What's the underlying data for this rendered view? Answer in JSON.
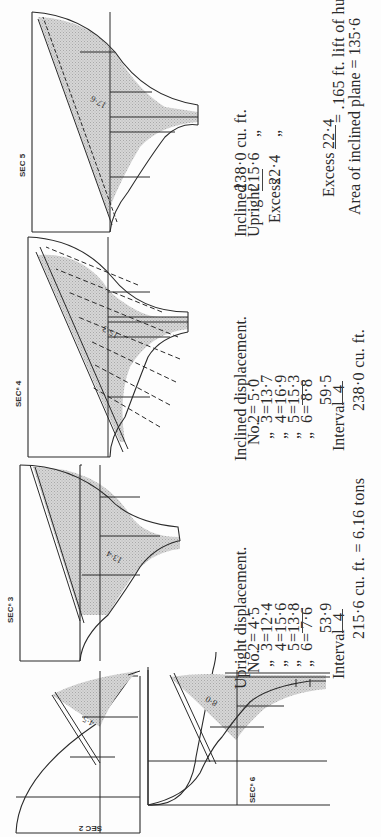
{
  "sections": [
    {
      "id": "sec2",
      "label": "SEC 2",
      "area_label": "4·5"
    },
    {
      "id": "sec6",
      "label": "SECⁿ 6",
      "area_label": "8·0"
    },
    {
      "id": "sec3",
      "label": "SECⁿ 3",
      "area_label": "13·4"
    },
    {
      "id": "sec4",
      "label": "SECⁿ 4",
      "area_label": "15·3"
    },
    {
      "id": "sec5",
      "label": "SEC 5",
      "area_label": "17·6"
    }
  ],
  "upright": {
    "heading": "Upright displacement.",
    "rows": [
      {
        "prefix": "No.",
        "n": "2",
        "value": "4·5"
      },
      {
        "prefix": "„",
        "n": "3",
        "value": "12·4"
      },
      {
        "prefix": "„",
        "n": "4",
        "value": "15·6"
      },
      {
        "prefix": "„",
        "n": "5",
        "value": "13·8"
      },
      {
        "prefix": "„",
        "n": "6",
        "value": "7·6"
      }
    ],
    "sum": "53·9",
    "interval_label": "Interval",
    "interval": "4",
    "result": "215·6 cu.  ft. = 6.16 tons"
  },
  "inclined": {
    "heading": "Inclined displacement.",
    "rows": [
      {
        "prefix": "No.",
        "n": "2",
        "value": "5·0"
      },
      {
        "prefix": "„",
        "n": "3",
        "value": "13·7"
      },
      {
        "prefix": "„",
        "n": "4",
        "value": "16·9"
      },
      {
        "prefix": "„",
        "n": "5",
        "value": "15·3"
      },
      {
        "prefix": "„",
        "n": "6",
        "value": "8·8"
      }
    ],
    "sum": "59·5",
    "interval_label": "Interval",
    "interval": "4",
    "result": "238·0 cu.  ft."
  },
  "comparison": {
    "inclined_label": "Inclined",
    "inclined_value": "238·0 cu.  ft.",
    "upright_label": "Upright",
    "upright_value": "215·6",
    "ditto": "„",
    "excess_label": "Excess",
    "excess_value": "22·4"
  },
  "lift": {
    "excess_label": "Excess",
    "numerator": "22·4",
    "result": "= .165 ft. lift of hull.",
    "denominator_text": "Area of inclined plane = 135·6"
  },
  "colors": {
    "ink": "#2a2a2a",
    "shade": "#c9c9c9",
    "paper": "#fdfdfd"
  }
}
